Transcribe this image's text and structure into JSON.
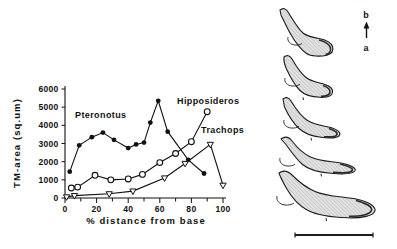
{
  "figure": {
    "background": "#ffffff",
    "ink_color": "#111111"
  },
  "chart_data": {
    "type": "line",
    "title": "",
    "xlabel": "% distance from base",
    "ylabel": "TM-area (sq.um)",
    "xlim": [
      0,
      100
    ],
    "ylim": [
      0,
      6000
    ],
    "xticks_major": [
      0,
      20,
      40,
      60,
      80,
      100
    ],
    "xticks_minor": [
      10,
      30,
      50,
      70,
      90
    ],
    "yticks": [
      0,
      1000,
      2000,
      3000,
      4000,
      5000,
      6000
    ],
    "grid": false,
    "legend_position": "inline-labels",
    "series": [
      {
        "name": "Pteronotus",
        "marker": "filled-circle",
        "color": "#111111",
        "label_pos": [
          75,
          118
        ],
        "x": [
          3,
          9,
          17,
          24,
          31,
          40,
          45,
          50,
          54,
          59,
          65,
          78,
          88
        ],
        "y": [
          1450,
          2900,
          3350,
          3600,
          3200,
          2750,
          2950,
          3050,
          4150,
          5350,
          3650,
          2100,
          1350
        ]
      },
      {
        "name": "Hipposideros",
        "marker": "open-circle",
        "color": "#111111",
        "label_pos": [
          177,
          104
        ],
        "x": [
          4,
          8,
          19,
          29,
          40,
          49,
          60,
          70,
          80,
          90
        ],
        "y": [
          550,
          600,
          1250,
          1000,
          1050,
          1300,
          1950,
          2450,
          3100,
          4750
        ]
      },
      {
        "name": "Trachops",
        "marker": "open-triangle-down",
        "color": "#111111",
        "label_pos": [
          201,
          133
        ],
        "x": [
          1,
          6,
          28,
          43,
          63,
          76,
          92,
          100
        ],
        "y": [
          60,
          130,
          230,
          380,
          1100,
          1900,
          2950,
          700
        ]
      }
    ]
  },
  "right_panel": {
    "description": "five hatched tectorial membrane cross-sections, base to apex",
    "shape_count": 5,
    "orientation": {
      "top_label": "b",
      "bottom_label": "a",
      "arrow_icon": "up-arrow"
    },
    "scale_bar": {
      "present": true,
      "label": ""
    }
  }
}
